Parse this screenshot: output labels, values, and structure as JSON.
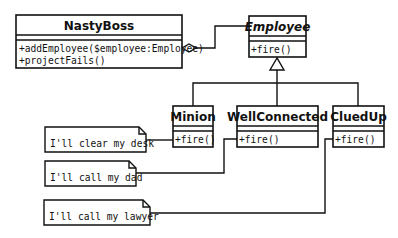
{
  "diagram": {
    "type": "UML class diagram",
    "classes": [
      {
        "name": "NastyBoss",
        "abstract": false,
        "attributes": [],
        "methods": [
          "+addEmployee($employee:Employee)",
          "+projectFails()"
        ]
      },
      {
        "name": "Employee",
        "abstract": true,
        "attributes": [],
        "methods": [
          "+fire()"
        ]
      },
      {
        "name": "Minion",
        "abstract": false,
        "attributes": [],
        "methods": [
          "+fire()"
        ]
      },
      {
        "name": "WellConnected",
        "abstract": false,
        "attributes": [],
        "methods": [
          "+fire()"
        ]
      },
      {
        "name": "CluedUp",
        "abstract": false,
        "attributes": [],
        "methods": [
          "+fire()"
        ]
      }
    ],
    "notes": [
      {
        "text": "I'll clear my desk",
        "attached_to": "Minion"
      },
      {
        "text": "I'll call my dad",
        "attached_to": "WellConnected"
      },
      {
        "text": "I'll call my lawyer",
        "attached_to": "CluedUp"
      }
    ],
    "relationships": [
      {
        "type": "aggregation",
        "from": "NastyBoss",
        "to": "Employee"
      },
      {
        "type": "generalization",
        "from": "Minion",
        "to": "Employee"
      },
      {
        "type": "generalization",
        "from": "WellConnected",
        "to": "Employee"
      },
      {
        "type": "generalization",
        "from": "CluedUp",
        "to": "Employee"
      }
    ],
    "colors": {
      "stroke": "#111111",
      "background": "#ffffff"
    }
  }
}
